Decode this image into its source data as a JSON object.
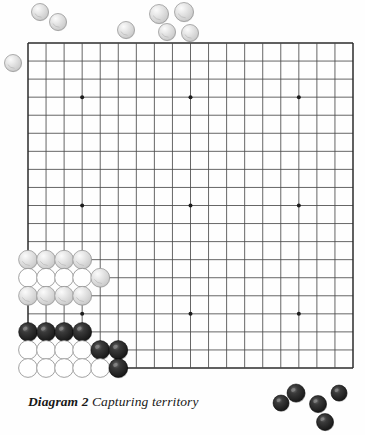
{
  "figure": {
    "kind": "go-board-diagram",
    "caption_label": "Diagram 2",
    "caption_text": "Capturing territory",
    "board": {
      "size": 19,
      "left": 28,
      "top": 43,
      "right": 353,
      "bottom": 380,
      "spacing": 18.06,
      "line_color": "#4a4a4a",
      "edge_color": "#2b2b2b",
      "star_color": "#1c1c1c",
      "star_points": [
        {
          "col": 3,
          "row": 3
        },
        {
          "col": 9,
          "row": 3
        },
        {
          "col": 15,
          "row": 3
        },
        {
          "col": 3,
          "row": 9
        },
        {
          "col": 9,
          "row": 9
        },
        {
          "col": 15,
          "row": 9
        },
        {
          "col": 3,
          "row": 15
        },
        {
          "col": 9,
          "row": 15
        },
        {
          "col": 15,
          "row": 15
        }
      ]
    },
    "colors": {
      "black_stone": "#1a1a1a",
      "black_stone_highlight": "#6d6d6d",
      "white_stone_shaded": "#d8d8d8",
      "white_stone_shaded_edge": "#8e8e8e",
      "white_stone_outline": "#ffffff",
      "white_stone_outline_edge": "#8a8a8a",
      "page_background": "#fefefe"
    },
    "board_stones": [
      {
        "col": 0,
        "row": 12,
        "color": "white",
        "style": "shaded"
      },
      {
        "col": 1,
        "row": 12,
        "color": "white",
        "style": "shaded"
      },
      {
        "col": 2,
        "row": 12,
        "color": "white",
        "style": "shaded"
      },
      {
        "col": 3,
        "row": 12,
        "color": "white",
        "style": "shaded"
      },
      {
        "col": 0,
        "row": 13,
        "color": "white",
        "style": "outline"
      },
      {
        "col": 1,
        "row": 13,
        "color": "white",
        "style": "outline"
      },
      {
        "col": 2,
        "row": 13,
        "color": "white",
        "style": "outline"
      },
      {
        "col": 3,
        "row": 13,
        "color": "white",
        "style": "outline"
      },
      {
        "col": 4,
        "row": 13,
        "color": "white",
        "style": "shaded"
      },
      {
        "col": 0,
        "row": 14,
        "color": "white",
        "style": "shaded"
      },
      {
        "col": 1,
        "row": 14,
        "color": "white",
        "style": "shaded"
      },
      {
        "col": 2,
        "row": 14,
        "color": "white",
        "style": "shaded"
      },
      {
        "col": 3,
        "row": 14,
        "color": "white",
        "style": "shaded"
      },
      {
        "col": 0,
        "row": 16,
        "color": "black",
        "style": "solid"
      },
      {
        "col": 1,
        "row": 16,
        "color": "black",
        "style": "solid"
      },
      {
        "col": 2,
        "row": 16,
        "color": "black",
        "style": "solid"
      },
      {
        "col": 3,
        "row": 16,
        "color": "black",
        "style": "solid"
      },
      {
        "col": 0,
        "row": 17,
        "color": "white",
        "style": "outline"
      },
      {
        "col": 1,
        "row": 17,
        "color": "white",
        "style": "outline"
      },
      {
        "col": 2,
        "row": 17,
        "color": "white",
        "style": "outline"
      },
      {
        "col": 3,
        "row": 17,
        "color": "white",
        "style": "outline"
      },
      {
        "col": 4,
        "row": 17,
        "color": "black",
        "style": "solid"
      },
      {
        "col": 5,
        "row": 17,
        "color": "black",
        "style": "solid"
      },
      {
        "col": 0,
        "row": 18,
        "color": "white",
        "style": "outline"
      },
      {
        "col": 1,
        "row": 18,
        "color": "white",
        "style": "outline"
      },
      {
        "col": 2,
        "row": 18,
        "color": "white",
        "style": "outline"
      },
      {
        "col": 3,
        "row": 18,
        "color": "white",
        "style": "outline"
      },
      {
        "col": 4,
        "row": 18,
        "color": "white",
        "style": "outline"
      },
      {
        "col": 5,
        "row": 18,
        "color": "black",
        "style": "solid"
      }
    ],
    "captured_white_stones": [
      {
        "x": 40,
        "y": 12,
        "r": 8.5
      },
      {
        "x": 58,
        "y": 22,
        "r": 8.5
      },
      {
        "x": 13,
        "y": 63,
        "r": 8.5
      },
      {
        "x": 126,
        "y": 30,
        "r": 8.5
      },
      {
        "x": 159,
        "y": 14,
        "r": 9.5
      },
      {
        "x": 184,
        "y": 12,
        "r": 9.5
      },
      {
        "x": 167,
        "y": 32,
        "r": 8.5
      },
      {
        "x": 190,
        "y": 33,
        "r": 8.5
      }
    ],
    "captured_black_stones": [
      {
        "x": 281,
        "y": 403,
        "r": 8.0
      },
      {
        "x": 296,
        "y": 393,
        "r": 9.0
      },
      {
        "x": 318,
        "y": 404,
        "r": 8.5
      },
      {
        "x": 339,
        "y": 393,
        "r": 8.0
      },
      {
        "x": 325,
        "y": 422,
        "r": 8.5
      }
    ]
  }
}
